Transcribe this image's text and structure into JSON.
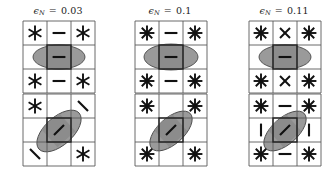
{
  "figure": {
    "type": "glyph-grid-array",
    "rows": 2,
    "cols": 3,
    "background": "#ffffff",
    "cell_stroke": "#5a5a5a",
    "glyph_color": "#111111",
    "ellipse_fill": "#9a9a9a",
    "ellipse_stroke": "#4a4a4a",
    "center_cell_fill": "#8c8c8c",
    "center_cell_stroke": "#222222"
  },
  "chart_data": {
    "type": "heatmap",
    "title": "",
    "xlabel": "",
    "ylabel": "",
    "legend": [],
    "columns": [
      {
        "label_text": "ϵN = 0.03",
        "epsilon_symbol": "ϵ",
        "subscript": "N",
        "equals": "=",
        "value": "0.03"
      },
      {
        "label_text": "ϵN = 0.1",
        "epsilon_symbol": "ϵ",
        "subscript": "N",
        "equals": "=",
        "value": "0.1"
      },
      {
        "label_text": "ϵN = 0.11",
        "epsilon_symbol": "ϵ",
        "subscript": "N",
        "equals": "=",
        "value": "0.11"
      }
    ],
    "panels": [
      {
        "row": 0,
        "col": 0,
        "noise_level": "0.03",
        "glyphs": [
          [
            "star6",
            "dash",
            "star6"
          ],
          [
            "blank",
            "dash",
            "blank"
          ],
          [
            "star6",
            "dash",
            "star6"
          ]
        ],
        "ellipse": {
          "cx": 36,
          "cy": 36,
          "rx": 26,
          "ry": 12,
          "angle": 0
        }
      },
      {
        "row": 0,
        "col": 1,
        "noise_level": "0.1",
        "glyphs": [
          [
            "star8",
            "dash",
            "star8"
          ],
          [
            "blank",
            "dash",
            "blank"
          ],
          [
            "star8",
            "dash",
            "star8"
          ]
        ],
        "ellipse": {
          "cx": 36,
          "cy": 36,
          "rx": 27,
          "ry": 13,
          "angle": 0
        }
      },
      {
        "row": 0,
        "col": 2,
        "noise_level": "0.11",
        "glyphs": [
          [
            "star8",
            "cross",
            "star8"
          ],
          [
            "blank",
            "dash",
            "blank"
          ],
          [
            "star8",
            "cross",
            "star8"
          ]
        ],
        "ellipse": {
          "cx": 36,
          "cy": 36,
          "rx": 26,
          "ry": 12,
          "angle": 0
        }
      },
      {
        "row": 1,
        "col": 0,
        "noise_level": "0.03",
        "glyphs": [
          [
            "star6",
            "blank",
            "backslash"
          ],
          [
            "blank",
            "slash",
            "blank"
          ],
          [
            "backslash",
            "blank",
            "star6"
          ]
        ],
        "ellipse": {
          "cx": 36,
          "cy": 37,
          "rx": 27,
          "ry": 14,
          "angle": -42
        }
      },
      {
        "row": 1,
        "col": 1,
        "noise_level": "0.1",
        "glyphs": [
          [
            "star8",
            "blank",
            "star8"
          ],
          [
            "blank",
            "slash",
            "blank"
          ],
          [
            "star8",
            "blank",
            "star8"
          ]
        ],
        "ellipse": {
          "cx": 36,
          "cy": 37,
          "rx": 26,
          "ry": 13,
          "angle": -42
        }
      },
      {
        "row": 1,
        "col": 2,
        "noise_level": "0.11",
        "glyphs": [
          [
            "star8",
            "dash",
            "star8"
          ],
          [
            "bar",
            "slash",
            "bar"
          ],
          [
            "star8",
            "dash",
            "star8"
          ]
        ],
        "ellipse": {
          "cx": 36,
          "cy": 37,
          "rx": 26,
          "ry": 13,
          "angle": -42
        }
      }
    ]
  }
}
